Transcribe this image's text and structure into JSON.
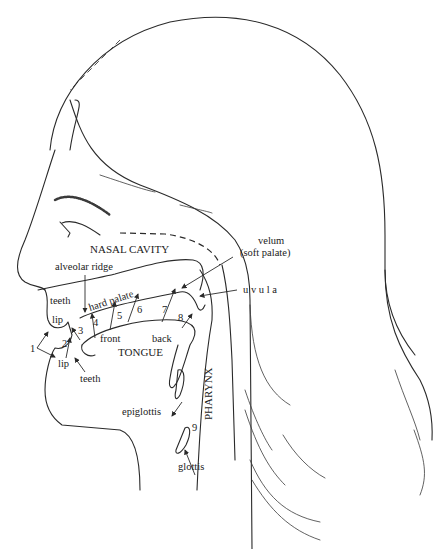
{
  "figure": {
    "type": "anatomical-diagram",
    "colors": {
      "line": "#2a2a2a",
      "background": "#ffffff",
      "text": "#222222"
    }
  },
  "regions": {
    "nasal_cavity": "NASAL CAVITY",
    "tongue": "TONGUE",
    "pharynx": "PHARYNX"
  },
  "labels": {
    "alveolar_ridge": "alveolar ridge",
    "hard_palate": "hard palate",
    "velum": "velum",
    "soft_palate": "(soft palate)",
    "uvula": "u v u l a",
    "teeth_upper": "teeth",
    "teeth_lower": "teeth",
    "lip_upper": "lip",
    "lip_lower": "lip",
    "front": "front",
    "back": "back",
    "epiglottis": "epiglottis",
    "glottis": "glottis"
  },
  "articulation_points": [
    {
      "num": "1",
      "place": "bilabial"
    },
    {
      "num": "2",
      "place": "labiodental"
    },
    {
      "num": "3",
      "place": "dental"
    },
    {
      "num": "4",
      "place": "alveolar"
    },
    {
      "num": "5",
      "place": "alveopalatal"
    },
    {
      "num": "6",
      "place": "palatal"
    },
    {
      "num": "7",
      "place": "velar"
    },
    {
      "num": "8",
      "place": "uvular"
    },
    {
      "num": "9",
      "place": "glottal"
    }
  ]
}
